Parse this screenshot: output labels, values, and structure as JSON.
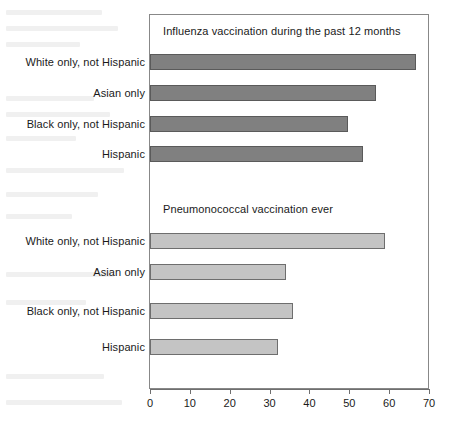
{
  "chart_data": {
    "type": "bar",
    "orientation": "horizontal",
    "title": "",
    "xlabel": "",
    "ylabel": "",
    "xlim": [
      0,
      70
    ],
    "xticks": [
      0,
      10,
      20,
      30,
      40,
      50,
      60,
      70
    ],
    "grid": false,
    "legend": "none",
    "categories": [
      "White only, not Hispanic",
      "Asian only",
      "Black only, not Hispanic",
      "Hispanic"
    ],
    "panels": [
      {
        "title": "Influenza vaccination during the past 12 months",
        "color": "#808080",
        "values": [
          66.7,
          56.7,
          49.6,
          53.4
        ]
      },
      {
        "title": "Pneumonococcal vaccination ever",
        "color": "#c4c4c4",
        "values": [
          59.0,
          34.0,
          36.0,
          32.0
        ]
      }
    ]
  },
  "axis": {
    "tick_labels": [
      "0",
      "10",
      "20",
      "30",
      "40",
      "50",
      "60",
      "70"
    ]
  },
  "colors": {
    "influenza_bar": "#808080",
    "pneumococcal_bar": "#c4c4c4",
    "frame": "#888888",
    "axis": "#6f6f6f",
    "text": "#1a1a1a",
    "background": "#ffffff"
  }
}
